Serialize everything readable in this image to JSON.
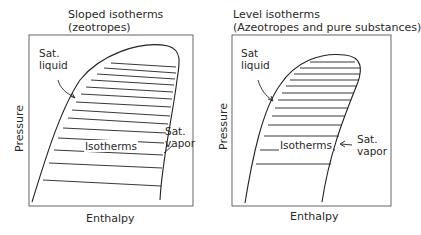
{
  "left_panel": {
    "title_line1": "Sloped isotherms",
    "title_line2": "(zeotropes)",
    "sat_liquid_line1": "Sat.",
    "sat_liquid_line2": "liquid",
    "sat_vapor_line1": "Sat.",
    "sat_vapor_line2": "vapor",
    "isotherms_label": "Isotherms",
    "x_axis_label": "Enthalpy",
    "y_axis_label": "Pressure"
  },
  "right_panel": {
    "title_line1": "Level isotherms",
    "title_line2": "(Azeotropes and pure substances)",
    "sat_liquid_line1": "Sat",
    "sat_liquid_line2": "liquid",
    "sat_vapor_line1": "Sat.",
    "sat_vapor_line2": "vapor",
    "isotherms_label": "Isotherms",
    "x_axis_label": "Enthalpy",
    "y_axis_label": "Pressure"
  },
  "colors": {
    "line": "#222222",
    "box": "#555555"
  }
}
